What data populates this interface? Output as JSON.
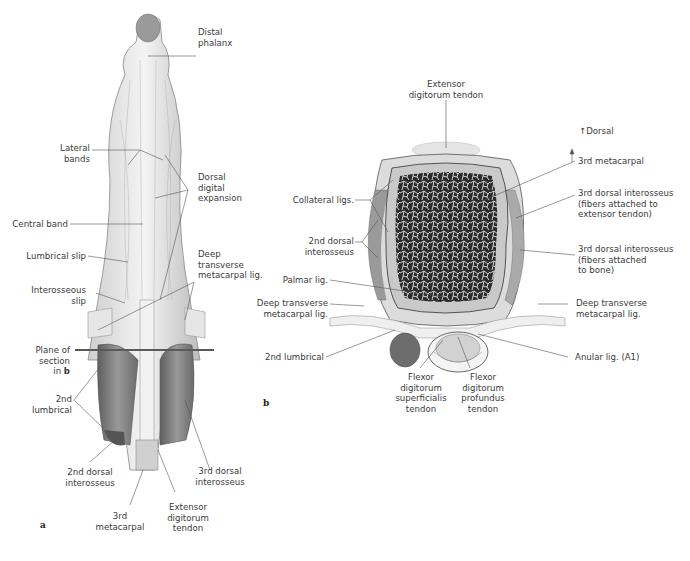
{
  "figure": {
    "panel_a": {
      "letter": "a",
      "labels": {
        "distal_phalanx": "Distal\nphalanx",
        "lateral_bands": "Lateral\nbands",
        "dorsal_digital_expansion": "Dorsal\ndigital\nexpansion",
        "central_band": "Central band",
        "lumbrical_slip": "Lumbrical slip",
        "deep_transverse_metacarpal_lig": "Deep\ntransverse\nmetacarpal lig.",
        "interosseous_slip": "Interosseous\nslip",
        "plane_of_section": "Plane of\nsection\nin ",
        "plane_of_section_ref": "b",
        "second_lumbrical": "2nd\nlumbrical",
        "second_dorsal_interosseus": "2nd dorsal\ninterosseus",
        "third_dorsal_interosseus": "3rd dorsal\ninterosseus",
        "third_metacarpal": "3rd\nmetacarpal",
        "extensor_digitorum_tendon": "Extensor\ndigitorum\ntendon"
      }
    },
    "panel_b": {
      "letter": "b",
      "orientation": "Dorsal",
      "labels": {
        "extensor_digitorum_tendon": "Extensor\ndigitorum tendon",
        "third_metacarpal": "3rd metacarpal",
        "third_dorsal_interosseus_tendon": "3rd dorsal interosseus\n(fibers attached to\nextensor tendon)",
        "third_dorsal_interosseus_bone": "3rd dorsal interosseus\n(fibers attached\nto bone)",
        "collateral_ligs": "Collateral ligs.",
        "second_dorsal_interosseus": "2nd dorsal\ninterosseus",
        "palmar_lig": "Palmar lig.",
        "deep_transverse_left": "Deep transverse\nmetacarpal lig.",
        "deep_transverse_right": "Deep transverse\nmetacarpal lig.",
        "second_lumbrical": "2nd lumbrical",
        "anular_lig": "Anular lig. (A1)",
        "fds_tendon": "Flexor\ndigitorum\nsuperficialis\ntendon",
        "fdp_tendon": "Flexor\ndigitorum\nprofundus\ntendon"
      }
    },
    "colors": {
      "leader_line": "#555555",
      "plane_line": "#5a5a5a",
      "bone_cortex": "#c9c9c9",
      "bone_marrow": "#2a2a2a",
      "muscle": "#7d7d7d",
      "tendon": "#ededed"
    }
  }
}
